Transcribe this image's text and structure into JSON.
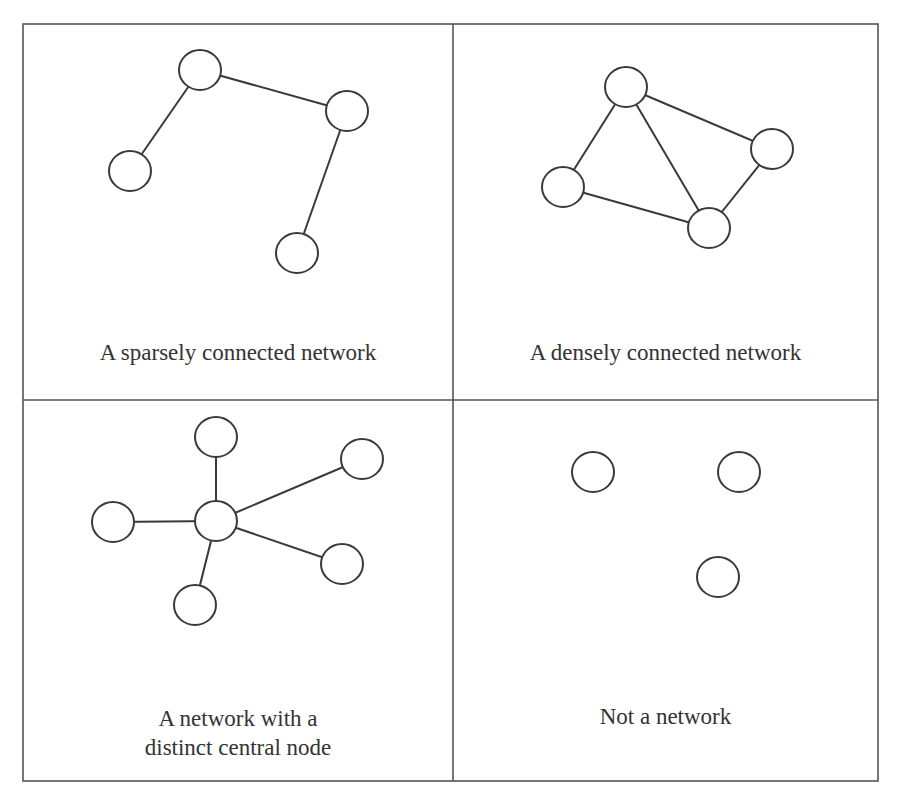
{
  "figure": {
    "frame": {
      "left": 23,
      "top": 24,
      "right": 878,
      "bottom": 781,
      "col_split": 453,
      "row_split": 400
    },
    "colors": {
      "line": "#3a3a3a",
      "frame": "#555555",
      "text": "#333333",
      "background": "#ffffff"
    },
    "node_radius": 20,
    "panels": [
      {
        "id": "sparse",
        "caption": "A sparsely connected network",
        "caption_box": {
          "left": 23,
          "top": 338,
          "width": 430,
          "lines": 1
        },
        "nodes": [
          [
            200,
            70
          ],
          [
            347,
            111
          ],
          [
            130,
            171
          ],
          [
            297,
            253
          ]
        ],
        "edges": [
          [
            0,
            1
          ],
          [
            0,
            2
          ],
          [
            1,
            3
          ]
        ]
      },
      {
        "id": "dense",
        "caption": "A densely connected network",
        "caption_box": {
          "left": 453,
          "top": 338,
          "width": 425,
          "lines": 1
        },
        "nodes": [
          [
            626,
            87
          ],
          [
            772,
            149
          ],
          [
            563,
            187
          ],
          [
            709,
            228
          ]
        ],
        "edges": [
          [
            0,
            1
          ],
          [
            0,
            2
          ],
          [
            0,
            3
          ],
          [
            1,
            3
          ],
          [
            2,
            3
          ]
        ]
      },
      {
        "id": "central",
        "caption": "A network with a\ndistinct central node",
        "caption_box": {
          "left": 23,
          "top": 704,
          "width": 430,
          "lines": 2
        },
        "nodes": [
          [
            216,
            521
          ],
          [
            216,
            437
          ],
          [
            362,
            459
          ],
          [
            113,
            522
          ],
          [
            342,
            564
          ],
          [
            195,
            605
          ]
        ],
        "edges": [
          [
            0,
            1
          ],
          [
            0,
            2
          ],
          [
            0,
            3
          ],
          [
            0,
            4
          ],
          [
            0,
            5
          ]
        ]
      },
      {
        "id": "none",
        "caption": "Not a network",
        "caption_box": {
          "left": 453,
          "top": 702,
          "width": 425,
          "lines": 1
        },
        "nodes": [
          [
            593,
            472
          ],
          [
            739,
            472
          ],
          [
            718,
            577
          ]
        ],
        "edges": []
      }
    ]
  }
}
